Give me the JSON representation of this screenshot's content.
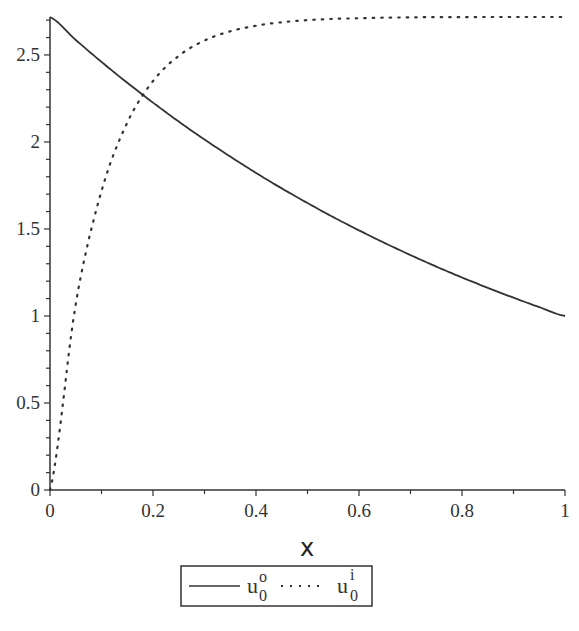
{
  "chart_data": {
    "type": "line",
    "title": "",
    "xlabel": "x",
    "ylabel": "",
    "xlim": [
      0,
      1
    ],
    "ylim": [
      0,
      2.718
    ],
    "grid": false,
    "legend_position": "bottom",
    "x_ticks": [
      "0",
      "0.2",
      "0.4",
      "0.6",
      "0.8",
      "1"
    ],
    "y_ticks": [
      "0",
      "0.5",
      "1",
      "1.5",
      "2",
      "2.5"
    ],
    "x": [
      0,
      0.05,
      0.1,
      0.15,
      0.2,
      0.25,
      0.3,
      0.35,
      0.4,
      0.45,
      0.5,
      0.55,
      0.6,
      0.65,
      0.7,
      0.75,
      0.8,
      0.85,
      0.9,
      0.95,
      1.0
    ],
    "series": [
      {
        "name": "u0^o",
        "style": "solid",
        "values": [
          2.718,
          2.586,
          2.46,
          2.34,
          2.226,
          2.117,
          2.014,
          1.916,
          1.822,
          1.733,
          1.649,
          1.568,
          1.492,
          1.419,
          1.35,
          1.284,
          1.221,
          1.162,
          1.105,
          1.051,
          1.0
        ]
      },
      {
        "name": "u0^i",
        "style": "dotted",
        "values": [
          0.0,
          1.07,
          1.718,
          2.111,
          2.35,
          2.495,
          2.583,
          2.636,
          2.668,
          2.688,
          2.7,
          2.707,
          2.711,
          2.714,
          2.716,
          2.717,
          2.717,
          2.718,
          2.718,
          2.718,
          2.718
        ]
      }
    ]
  },
  "legend": {
    "items": [
      {
        "base": "u",
        "sup": "o",
        "sub": "0"
      },
      {
        "base": "u",
        "sup": "i",
        "sub": "0"
      }
    ]
  }
}
